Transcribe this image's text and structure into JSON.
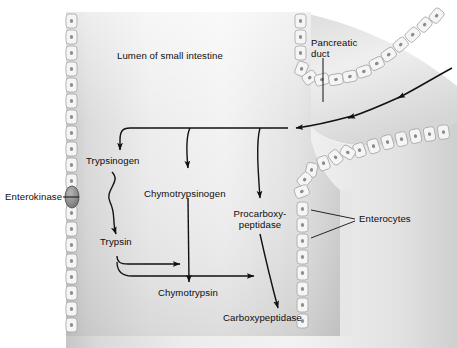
{
  "figure": {
    "type": "biological-pathway-diagram",
    "width": 457,
    "height": 348
  },
  "colors": {
    "background": "#ffffff",
    "lumen_light": "#f0f0f0",
    "lumen_mid": "#dcdcdc",
    "lumen_edge": "#c2c2c2",
    "cell_fill": "#f4f4f4",
    "cell_stroke": "#a8a8a8",
    "nucleus": "#8a8a8a",
    "ink": "#111111",
    "enterokinase_fill": "#9d9d9d",
    "enterokinase_stroke": "#555555"
  },
  "labels": {
    "lumen": "Lumen of small intestine",
    "pancreatic_duct": "Pancreatic\nduct",
    "pancreatic_duct_line1": "Pancreatic",
    "pancreatic_duct_line2": "duct",
    "enterocytes": "Enterocytes",
    "enterokinase": "Enterokinase",
    "trypsinogen": "Trypsinogen",
    "trypsin": "Trypsin",
    "chymotrypsinogen": "Chymotrypsinogen",
    "chymotrypsin": "Chymotrypsin",
    "procarboxypeptidase_line1": "Procarboxy-",
    "procarboxypeptidase_line2": "peptidase",
    "carboxypeptidase": "Carboxypeptidase"
  },
  "pathway": {
    "zymogens": [
      "Trypsinogen",
      "Chymotrypsinogen",
      "Procarboxypeptidase"
    ],
    "active_enzymes": [
      "Trypsin",
      "Chymotrypsin",
      "Carboxypeptidase"
    ],
    "conversions": [
      {
        "from": "Trypsinogen",
        "to": "Trypsin",
        "catalyst": "Enterokinase"
      },
      {
        "from": "Chymotrypsinogen",
        "to": "Chymotrypsin",
        "catalyst": "Trypsin"
      },
      {
        "from": "Procarboxypeptidase",
        "to": "Carboxypeptidase",
        "catalyst": "Trypsin"
      }
    ],
    "source": "Pancreatic duct",
    "compartment": "Lumen of small intestine",
    "wall_cells": "Enterocytes"
  }
}
